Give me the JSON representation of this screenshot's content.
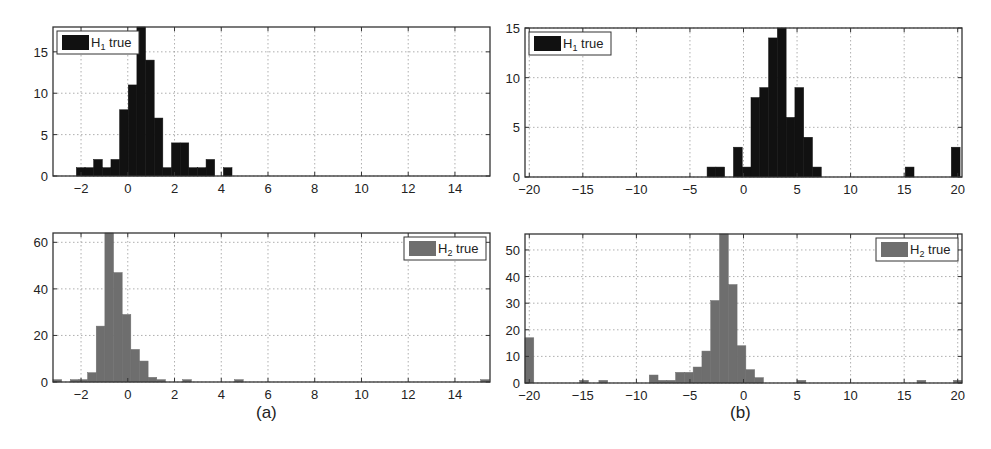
{
  "figure": {
    "captions": [
      "(a)",
      "(b)"
    ]
  },
  "colors": {
    "h1_bar": "#111111",
    "h2_bar": "#6e6e6e",
    "axis": "#333333",
    "grid": "#9a9a9a"
  },
  "chart_data": [
    {
      "id": "a-top",
      "type": "bar",
      "title": "",
      "xlabel": "",
      "ylabel": "",
      "legend": {
        "label": "H1 true",
        "main": "H",
        "sub": "1",
        "rest": " true",
        "position": "upper-left"
      },
      "xlim": [
        -3.2,
        15.5
      ],
      "ylim": [
        0,
        18
      ],
      "xticks": [
        -2,
        0,
        2,
        4,
        6,
        8,
        10,
        12,
        14
      ],
      "yticks": [
        0,
        5,
        10,
        15
      ],
      "grid": true,
      "bin_width": 0.37,
      "bin_starts": [
        -2.2,
        -1.83,
        -1.46,
        -1.09,
        -0.72,
        -0.35,
        0.02,
        0.39,
        0.76,
        1.13,
        1.5,
        1.87,
        2.24,
        2.61,
        2.98,
        3.35,
        3.72,
        4.09
      ],
      "values": [
        1,
        1,
        2,
        1,
        2,
        8,
        11,
        18,
        14,
        7,
        1,
        4,
        4,
        1,
        1,
        2,
        0,
        1
      ]
    },
    {
      "id": "b-top",
      "type": "bar",
      "title": "",
      "xlabel": "",
      "ylabel": "",
      "legend": {
        "label": "H1 true",
        "main": "H",
        "sub": "1",
        "rest": " true",
        "position": "upper-left"
      },
      "xlim": [
        -20.4,
        20.4
      ],
      "ylim": [
        0,
        15
      ],
      "xticks": [
        -20,
        -15,
        -10,
        -5,
        0,
        5,
        10,
        15,
        20
      ],
      "yticks": [
        0,
        5,
        10,
        15
      ],
      "grid": true,
      "bin_width": 0.82,
      "bin_starts": [
        -3.4,
        -2.58,
        -1.76,
        -0.94,
        -0.12,
        0.7,
        1.52,
        2.34,
        3.16,
        3.98,
        4.8,
        5.62,
        6.44,
        15.1,
        19.4
      ],
      "values": [
        1,
        1,
        0,
        3,
        1,
        8,
        9,
        14,
        15,
        6,
        9,
        4,
        1,
        1,
        3
      ]
    },
    {
      "id": "a-bottom",
      "type": "bar",
      "title": "",
      "xlabel": "",
      "ylabel": "",
      "legend": {
        "label": "H2 true",
        "main": "H",
        "sub": "2",
        "rest": " true",
        "position": "upper-right"
      },
      "xlim": [
        -3.2,
        15.5
      ],
      "ylim": [
        0,
        64
      ],
      "xticks": [
        -2,
        0,
        2,
        4,
        6,
        8,
        10,
        12,
        14
      ],
      "yticks": [
        0,
        20,
        40,
        60
      ],
      "grid": true,
      "bin_width": 0.37,
      "bin_starts": [
        -3.2,
        -2.46,
        -2.09,
        -1.72,
        -1.35,
        -0.98,
        -0.61,
        -0.24,
        0.13,
        0.5,
        0.87,
        1.24,
        2.35,
        4.57,
        15.1
      ],
      "values": [
        1,
        1,
        1,
        4,
        24,
        64,
        47,
        29,
        14,
        9,
        2,
        1,
        1,
        1,
        1
      ]
    },
    {
      "id": "b-bottom",
      "type": "bar",
      "title": "",
      "xlabel": "",
      "ylabel": "",
      "legend": {
        "label": "H2 true",
        "main": "H",
        "sub": "2",
        "rest": " true",
        "position": "upper-right"
      },
      "xlim": [
        -20.4,
        20.4
      ],
      "ylim": [
        0,
        56
      ],
      "xticks": [
        -20,
        -15,
        -10,
        -5,
        0,
        5,
        10,
        15,
        20
      ],
      "yticks": [
        0,
        10,
        20,
        30,
        40,
        50
      ],
      "grid": true,
      "bin_width": 0.82,
      "bin_starts": [
        -20.4,
        -15.3,
        -13.5,
        -8.8,
        -7.98,
        -7.16,
        -6.34,
        -5.52,
        -4.7,
        -3.88,
        -3.06,
        -2.24,
        -1.42,
        -0.6,
        0.22,
        1.04,
        5.0,
        16.2,
        19.6
      ],
      "values": [
        17,
        1,
        1,
        3,
        1,
        1,
        4,
        4,
        6,
        12,
        31,
        56,
        37,
        14,
        5,
        2,
        1,
        1,
        1
      ]
    }
  ]
}
